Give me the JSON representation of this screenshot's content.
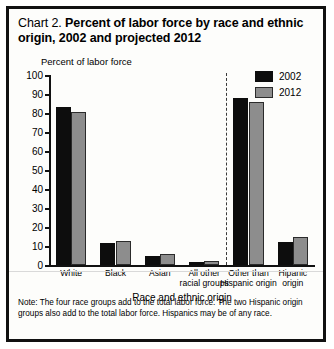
{
  "title": {
    "lead": "Chart 2.",
    "strong": "Percent of labor force by race and ethnic origin, 2002 and projected 2012"
  },
  "note": {
    "label": "Note:",
    "body": "The four race groups add to the total labor force. The two Hispanic origin groups also add to the total labor force. Hispanics may be of any race."
  },
  "legend": {
    "items": [
      {
        "label": "2002",
        "color": "#0d0d0d"
      },
      {
        "label": "2012",
        "color": "#8d8d8d"
      }
    ]
  },
  "chart_data": {
    "type": "bar",
    "title": "Chart 2. Percent of labor force by race and ethnic origin, 2002 and projected 2012",
    "xlabel": "Race and ethnic origin",
    "ylabel": "Percent of labor force",
    "categories": [
      "White",
      "Black",
      "Asian",
      "All other\nracial groups",
      "Other than\nHispanic origin",
      "Hipanic\norigin"
    ],
    "series": [
      {
        "name": "2002",
        "color": "#0d0d0d",
        "values": [
          83,
          11.5,
          4.5,
          1.5,
          88,
          12
        ]
      },
      {
        "name": "2012",
        "color": "#8d8d8d",
        "values": [
          80.5,
          12.5,
          6,
          2,
          86,
          15
        ]
      }
    ],
    "ylim": [
      0,
      100
    ],
    "yticks": [
      0,
      10,
      20,
      30,
      40,
      50,
      60,
      70,
      80,
      90,
      100
    ],
    "ytick_labels": [
      "0",
      "10",
      "20",
      "30",
      "40",
      "50",
      "60",
      "70",
      "80",
      "90",
      "100"
    ],
    "grid": false,
    "legend_position": "top-right",
    "group_divider_after_category_index": 3
  }
}
